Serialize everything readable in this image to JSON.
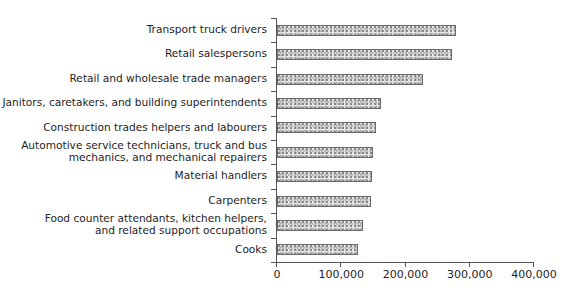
{
  "chart_data": {
    "type": "bar",
    "orientation": "horizontal",
    "title": "",
    "xlabel": "",
    "ylabel": "",
    "categories": [
      "Transport truck drivers",
      "Retail salespersons",
      "Retail and wholesale trade managers",
      "Janitors, caretakers, and building superintendents",
      "Construction trades helpers and labourers",
      "Automotive service technicians, truck and bus mechanics, and mechanical repairers",
      "Material handlers",
      "Carpenters",
      "Food counter attendants, kitchen helpers, and related support occupations",
      "Cooks"
    ],
    "category_label_lines": [
      [
        "Transport truck drivers"
      ],
      [
        "Retail salespersons"
      ],
      [
        "Retail and wholesale trade managers"
      ],
      [
        "Janitors, caretakers, and building superintendents"
      ],
      [
        "Construction trades helpers and labourers"
      ],
      [
        "Automotive service technicians, truck and bus",
        "mechanics, and mechanical repairers"
      ],
      [
        "Material handlers"
      ],
      [
        "Carpenters"
      ],
      [
        "Food counter attendants, kitchen helpers,",
        "and related support occupations"
      ],
      [
        "Cooks"
      ]
    ],
    "values": [
      279000,
      272000,
      227000,
      162000,
      154000,
      149000,
      148000,
      146000,
      134000,
      126000
    ],
    "xlim": [
      0,
      400000
    ],
    "x_ticks": [
      0,
      100000,
      200000,
      300000,
      400000
    ],
    "x_tick_labels": [
      "0",
      "100,000",
      "200,000",
      "300,000",
      "400,000"
    ],
    "grid": false,
    "legend": null,
    "bar_fill": "stippled gray pattern",
    "bar_border_color": "#6a6a6a"
  }
}
